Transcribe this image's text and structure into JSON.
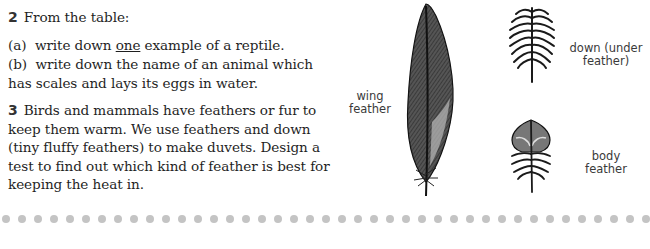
{
  "question2": {
    "number": "2",
    "intro": "From the table:",
    "part_a": {
      "label": "(a)",
      "before": "write down ",
      "underlined": "one",
      "after": " example of a reptile."
    },
    "part_b": {
      "label": "(b)",
      "line1": "write down the name of an animal which",
      "line2": "has scales and lays its eggs in water."
    }
  },
  "question3": {
    "number": "3",
    "lines": [
      "Birds and mammals have feathers or fur to",
      "keep them warm. We use feathers and down",
      "(tiny fluffy feathers) to make duvets. Design a",
      "test to find out which kind of feather is best for",
      "keeping the heat in."
    ]
  },
  "figure": {
    "wing_feather_label": [
      "wing",
      "feather"
    ],
    "down_feather_label": [
      "down (under",
      "feather)"
    ],
    "body_feather_label": [
      "body",
      "feather"
    ]
  },
  "divider": {
    "dot_count": 41,
    "dot_color": "#c4c4c4"
  }
}
